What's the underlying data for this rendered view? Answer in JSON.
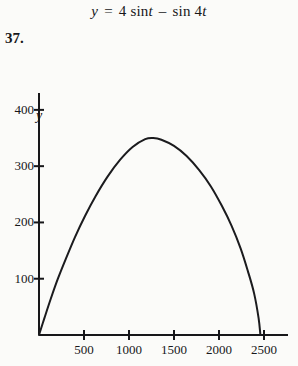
{
  "equation": {
    "lhs": "y",
    "equals": "=",
    "coefficient": "4",
    "fn1": "sin",
    "arg1": "t",
    "minus": "–",
    "fn2": "sin",
    "arg2": "4",
    "arg2_var": "t",
    "full_text": "y = 4 sin t – sin 4t"
  },
  "problem_number": "37.",
  "colors": {
    "background": "#fbfbf9",
    "ink": "#17171a",
    "curve": "#1b1b1e"
  },
  "chart_data": {
    "type": "line",
    "title": "",
    "xlabel": "x",
    "ylabel": "y",
    "xlim": [
      0,
      2600
    ],
    "ylim": [
      0,
      430
    ],
    "grid": false,
    "legend": null,
    "x_ticks": [
      500,
      1000,
      1500,
      2000,
      2500
    ],
    "x_tick_labels": [
      "500",
      "1000",
      "1500",
      "2000",
      "2500"
    ],
    "y_ticks": [
      100,
      200,
      300,
      400
    ],
    "y_tick_labels": [
      "100",
      "200",
      "300",
      "400"
    ],
    "annotations": [],
    "series": [
      {
        "name": "y = 4 sin t - sin 4t",
        "x": [
          0,
          60,
          130,
          210,
          300,
          400,
          510,
          630,
          760,
          900,
          1040,
          1180,
          1270,
          1360,
          1500,
          1640,
          1780,
          1910,
          2030,
          2140,
          2240,
          2320,
          2390,
          2440,
          2460
        ],
        "y": [
          0,
          30,
          64,
          100,
          136,
          174,
          211,
          247,
          281,
          311,
          334,
          348,
          350,
          347,
          336,
          318,
          293,
          264,
          230,
          194,
          154,
          114,
          74,
          30,
          0
        ]
      }
    ]
  }
}
